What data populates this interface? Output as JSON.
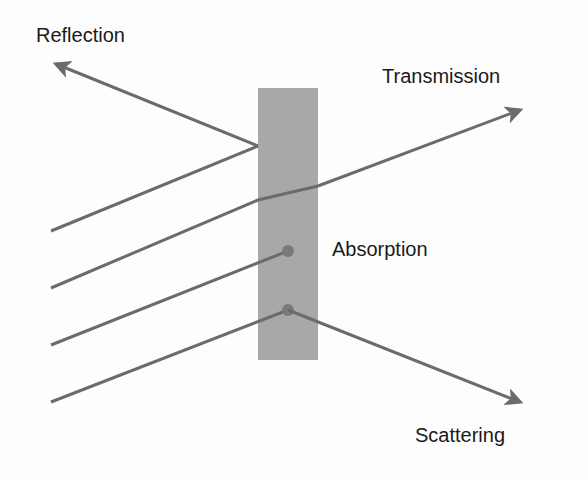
{
  "diagram": {
    "labels": {
      "reflection": "Reflection",
      "transmission": "Transmission",
      "absorption": "Absorption",
      "scattering": "Scattering"
    },
    "colors": {
      "ray": "#6b6b6b",
      "slab": "#a8a8a8",
      "text": "#1a1a1a",
      "background": "#fdfdfd"
    },
    "slab": {
      "x": 258,
      "y": 88,
      "width": 60,
      "height": 272
    }
  }
}
